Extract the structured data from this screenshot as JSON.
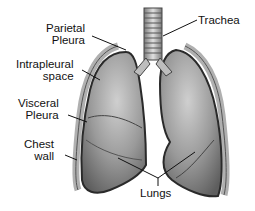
{
  "diagram": {
    "labels": {
      "parietal_pleura_line1": "Parietal",
      "parietal_pleura_line2": "Pleura",
      "trachea": "Trachea",
      "intrapleural_line1": "Intrapleural",
      "intrapleural_line2": "space",
      "visceral_pleura_line1": "Visceral",
      "visceral_pleura_line2": "Pleura",
      "chest_wall_line1": "Chest",
      "chest_wall_line2": "wall",
      "lungs": "Lungs"
    },
    "colors": {
      "lung_fill": "#8a8a8a",
      "lung_highlight": "#c8c8c8",
      "pleura_outline": "#333333",
      "chest_wall": "#b5b5b5",
      "background": "#ffffff"
    }
  }
}
